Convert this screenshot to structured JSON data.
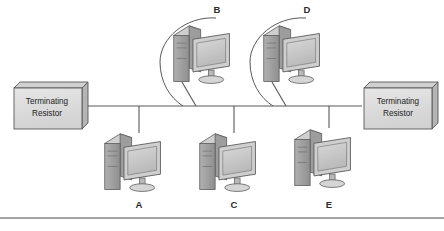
{
  "diagram": {
    "background_color": "#ffffff",
    "line_color": "#58585a",
    "fill_light": "#e3e3e3",
    "fill_mid": "#c9c9c9",
    "fill_dark": "#a8a8a8",
    "text_color": "#232323",
    "rule_color": "#4a4a4a"
  },
  "terminators": [
    {
      "id": "left-terminator",
      "line1": "Terminating",
      "line2": "Resistor",
      "x": 12,
      "y": 82
    },
    {
      "id": "right-terminator",
      "line1": "Terminating",
      "line2": "Resistor",
      "x": 363,
      "y": 82
    }
  ],
  "computers": [
    {
      "id": "computer-b",
      "label": "B",
      "position": "top",
      "label_x": 205,
      "label_y": 4
    },
    {
      "id": "computer-d",
      "label": "D",
      "position": "top",
      "label_x": 295,
      "label_y": 4
    },
    {
      "id": "computer-a",
      "label": "A",
      "position": "bottom",
      "label_x": 127,
      "label_y": 199
    },
    {
      "id": "computer-c",
      "label": "C",
      "position": "bottom",
      "label_x": 222,
      "label_y": 199
    },
    {
      "id": "computer-e",
      "label": "E",
      "position": "bottom",
      "label_x": 317,
      "label_y": 199
    }
  ],
  "bus": {
    "label": "bus-backbone-line",
    "y": 106,
    "x_start": 88,
    "x_end": 362
  },
  "footer_rule": {
    "label": "footer-divider",
    "y": 218
  }
}
